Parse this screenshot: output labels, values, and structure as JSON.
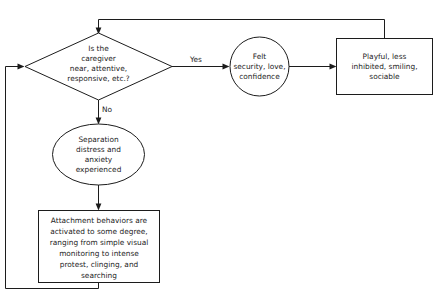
{
  "diagram": {
    "type": "flowchart",
    "colors": {
      "background": "#ffffff",
      "stroke": "#1c1c1c",
      "node_fill": "#ffffff",
      "text": "#1c1c1c"
    },
    "nodes": [
      {
        "id": "decision",
        "shape": "diamond",
        "lines": [
          "Is the",
          "caregiver",
          "near, attentive,",
          "responsive, etc.?"
        ]
      },
      {
        "id": "felt-security",
        "shape": "circle",
        "lines": [
          "Felt",
          "security, love,",
          "confidence"
        ]
      },
      {
        "id": "playful",
        "shape": "rectangle",
        "lines": [
          "Playful, less",
          "inhibited, smiling,",
          "sociable"
        ]
      },
      {
        "id": "separation-distress",
        "shape": "ellipse",
        "lines": [
          "Separation",
          "distress and",
          "anxiety",
          "experienced"
        ]
      },
      {
        "id": "attachment-behaviors",
        "shape": "rectangle",
        "lines": [
          "Attachment behaviors are",
          "activated to some degree,",
          "ranging from simple visual",
          "monitoring to intense",
          "protest, clinging, and",
          "searching"
        ]
      }
    ],
    "edges": [
      {
        "id": "yes-edge",
        "from": "decision",
        "to": "felt-security",
        "label": "Yes"
      },
      {
        "id": "no-edge",
        "from": "decision",
        "to": "separation-distress",
        "label": "No"
      },
      {
        "id": "security-to-playful",
        "from": "felt-security",
        "to": "playful",
        "label": ""
      },
      {
        "id": "distress-to-behaviors",
        "from": "separation-distress",
        "to": "attachment-behaviors",
        "label": ""
      },
      {
        "id": "playful-feedback",
        "from": "playful",
        "to": "decision",
        "label": ""
      },
      {
        "id": "behaviors-feedback",
        "from": "attachment-behaviors",
        "to": "decision",
        "label": ""
      }
    ]
  }
}
